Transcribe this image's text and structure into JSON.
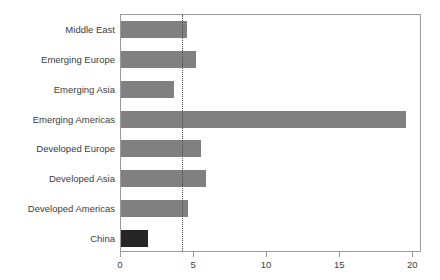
{
  "chart_data": {
    "type": "bar",
    "orientation": "horizontal",
    "title": "",
    "subtitle": "",
    "xlabel": "",
    "ylabel": "",
    "categories": [
      "Middle East",
      "Emerging Europe",
      "Emerging Asia",
      "Emerging Americas",
      "Developed Europe",
      "Developed Asia",
      "Developed Americas",
      "China"
    ],
    "values": [
      4.5,
      5.1,
      3.6,
      19.5,
      5.5,
      5.8,
      4.6,
      1.85
    ],
    "highlighted_category": "China",
    "xlim": [
      0,
      20.6
    ],
    "xticks": [
      0,
      5,
      10,
      15,
      20
    ],
    "xtick_labels": [
      "0",
      "5",
      "10",
      "15",
      "20"
    ],
    "grid": false,
    "legend": "none",
    "annotations": [
      {
        "name": "reference-line",
        "type": "vertical-dotted-line",
        "value": 4.2
      }
    ],
    "colors": {
      "bar": "#808080",
      "bar_highlight": "#262626",
      "axis": "#9a9a9a",
      "text": "#3d3d3d",
      "reference_line": "#4a4a4a",
      "background": "#ffffff"
    }
  }
}
